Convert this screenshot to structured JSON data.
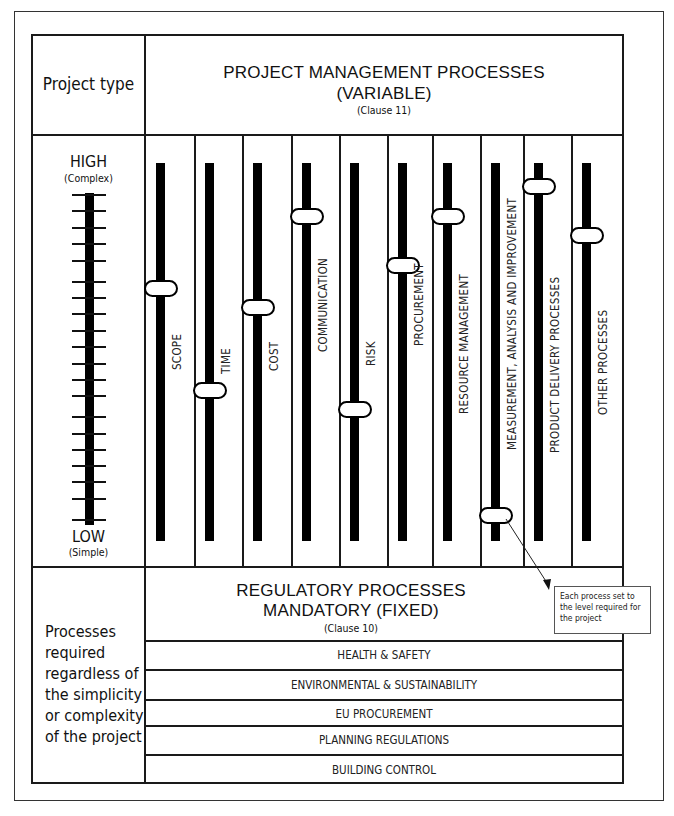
{
  "header": {
    "project_type_label": "Project type",
    "title_line1": "PROJECT MANAGEMENT PROCESSES",
    "title_line2": "(VARIABLE)",
    "clause": "(Clause 11)"
  },
  "scale": {
    "high_label": "HIGH",
    "high_sub": "(Complex)",
    "low_label": "LOW",
    "low_sub": "(Simple)",
    "tick_count": 21
  },
  "processes": [
    {
      "label": "SCOPE",
      "level_pct": 67
    },
    {
      "label": "TIME",
      "level_pct": 40
    },
    {
      "label": "COST",
      "level_pct": 62
    },
    {
      "label": "COMMUNICATION",
      "level_pct": 86
    },
    {
      "label": "RISK",
      "level_pct": 35
    },
    {
      "label": "PROCUREMENT",
      "level_pct": 73
    },
    {
      "label": "RESOURCE MANAGEMENT",
      "level_pct": 86
    },
    {
      "label": "MEASUREMENT, ANALYSIS AND IMPROVEMENT",
      "level_pct": 7
    },
    {
      "label": "PRODUCT DELIVERY PROCESSES",
      "level_pct": 94
    },
    {
      "label": "OTHER PROCESSES",
      "level_pct": 81
    }
  ],
  "callout": {
    "text": "Each process set to the level required for the project"
  },
  "regulatory": {
    "title_line1": "REGULATORY PROCESSES",
    "title_line2": "MANDATORY (FIXED)",
    "clause": "(Clause 10)",
    "left_text": [
      "Processes",
      "required",
      "regardless of",
      "the simplicity",
      "or complexity",
      "of the project"
    ],
    "rows": [
      "HEALTH & SAFETY",
      "ENVIRONMENTAL & SUSTAINABILITY",
      "EU PROCUREMENT",
      "PLANNING REGULATIONS",
      "BUILDING CONTROL"
    ]
  }
}
